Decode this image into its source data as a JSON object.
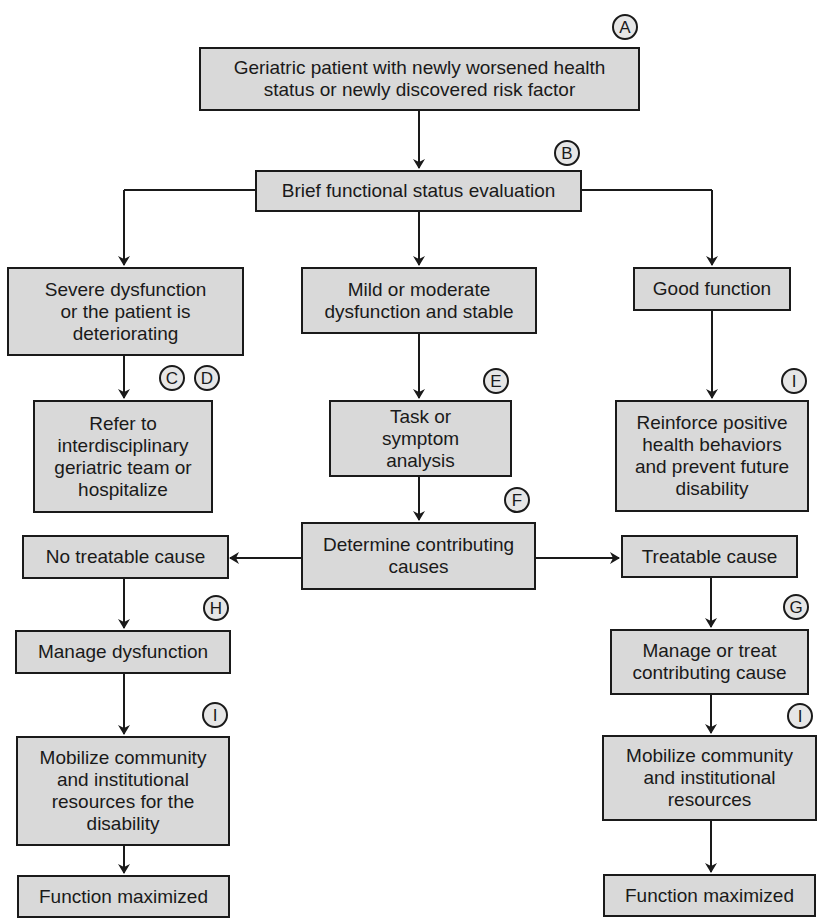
{
  "diagram": {
    "type": "flowchart",
    "colors": {
      "box_fill": "#d9d9d9",
      "border": "#1a1a1a",
      "tag_fill": "#e6e6e6",
      "background": "#ffffff"
    },
    "nodes": {
      "start": {
        "label": "Geriatric patient with newly worsened health status or newly discovered risk factor",
        "tag": "A"
      },
      "eval": {
        "label": "Brief functional status evaluation",
        "tag": "B"
      },
      "severe": {
        "label": "Severe dysfunction or the patient is deteriorating"
      },
      "mild": {
        "label": "Mild or moderate dysfunction and stable"
      },
      "good": {
        "label": "Good function"
      },
      "refer": {
        "label": "Refer to interdisciplinary geriatric team or hospitalize",
        "tags": [
          "C",
          "D"
        ]
      },
      "task": {
        "label": "Task or symptom analysis",
        "tag": "E"
      },
      "reinforce": {
        "label": "Reinforce positive health behaviors and prevent future disability",
        "tag": "I"
      },
      "determine": {
        "label": "Determine contributing causes",
        "tag": "F"
      },
      "no_treatable": {
        "label": "No treatable cause"
      },
      "treatable": {
        "label": "Treatable cause"
      },
      "manage_dys": {
        "label": "Manage dysfunction",
        "tag": "H"
      },
      "manage_treat": {
        "label": "Manage or treat contributing cause",
        "tag": "G"
      },
      "mobilize_left": {
        "label": "Mobilize community and institutional resources for the disability",
        "tag": "I"
      },
      "mobilize_right": {
        "label": "Mobilize community and institutional resources",
        "tag": "I"
      },
      "max_left": {
        "label": "Function maximized"
      },
      "max_right": {
        "label": "Function maximized"
      }
    },
    "edges": [
      [
        "start",
        "eval"
      ],
      [
        "eval",
        "severe"
      ],
      [
        "eval",
        "mild"
      ],
      [
        "eval",
        "good"
      ],
      [
        "severe",
        "refer"
      ],
      [
        "mild",
        "task"
      ],
      [
        "good",
        "reinforce"
      ],
      [
        "task",
        "determine"
      ],
      [
        "determine",
        "no_treatable"
      ],
      [
        "determine",
        "treatable"
      ],
      [
        "no_treatable",
        "manage_dys"
      ],
      [
        "treatable",
        "manage_treat"
      ],
      [
        "manage_dys",
        "mobilize_left"
      ],
      [
        "manage_treat",
        "mobilize_right"
      ],
      [
        "mobilize_left",
        "max_left"
      ],
      [
        "mobilize_right",
        "max_right"
      ]
    ]
  }
}
